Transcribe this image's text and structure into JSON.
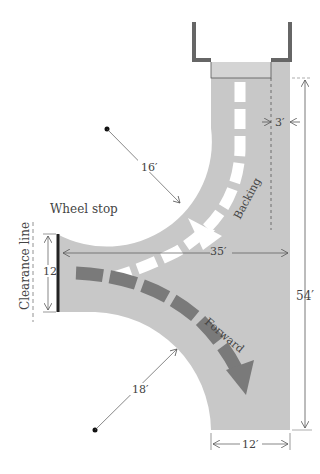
{
  "diagram": {
    "labels": {
      "wheel_stop": "Wheel stop",
      "clearance_line": "Clearance line",
      "backing": "Backing",
      "forward": "Forward"
    },
    "dimensions": {
      "offset": "3′",
      "radius_top": "16′",
      "radius_bottom": "18′",
      "width_left": "12",
      "length_horizontal": "35′",
      "length_vertical": "54′",
      "width_bottom": "12′"
    },
    "colors": {
      "pavement": "#c8c8c8",
      "forward_arrow": "#7a7a7a",
      "backing_arrow": "#ffffff",
      "garage_wall": "#666666",
      "dimension_line": "#555555"
    }
  }
}
